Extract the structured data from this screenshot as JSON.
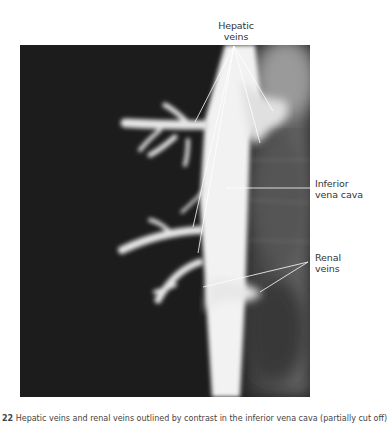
{
  "figure": {
    "type": "radiograph",
    "labels": {
      "hepatic": [
        "Hepatic",
        "veins"
      ],
      "ivc": [
        "Inferior",
        "vena cava"
      ],
      "renal": [
        "Renal",
        "veins"
      ]
    },
    "caption": {
      "number": "22",
      "text": "Hepatic veins and renal veins outlined by contrast in the inferior vena cava (partially cut off)"
    },
    "colors": {
      "background": "#ffffff",
      "film_dark": "#1c1c1c",
      "contrast": "#f2f2f2",
      "leader_line": "#ffffff",
      "label_text": "#333333"
    }
  }
}
